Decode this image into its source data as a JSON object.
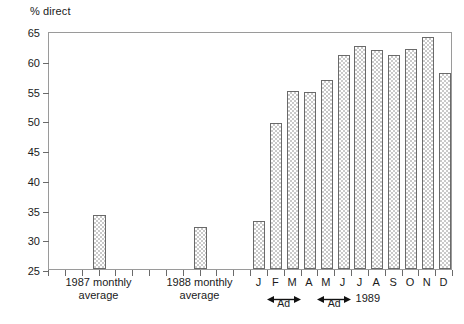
{
  "chart_data": {
    "type": "bar",
    "title": "",
    "ylabel": "% direct",
    "xlabel": "",
    "ylim": [
      25,
      65
    ],
    "ytick_labels": [
      "25",
      "30",
      "35",
      "40",
      "45",
      "50",
      "55",
      "60",
      "65"
    ],
    "ytick_values": [
      25,
      30,
      35,
      40,
      45,
      50,
      55,
      60,
      65
    ],
    "grid": false,
    "legend": "none",
    "categories": [
      "1987 monthly average",
      "1988 monthly average",
      "J",
      "F",
      "M",
      "A",
      "M",
      "J",
      "J",
      "A",
      "S",
      "O",
      "N",
      "D"
    ],
    "values": [
      34.1,
      32.0,
      33.0,
      49.5,
      55.0,
      54.7,
      56.8,
      61.0,
      62.5,
      61.8,
      61.0,
      62.0,
      64.0,
      58.0
    ],
    "series": [
      {
        "name": "% direct",
        "values": [
          34.1,
          32.0,
          33.0,
          49.5,
          55.0,
          54.7,
          56.8,
          61.0,
          62.5,
          61.8,
          61.0,
          62.0,
          64.0,
          58.0
        ]
      }
    ],
    "annotations": [
      {
        "label": "Ad",
        "span": [
          "F",
          "M"
        ]
      },
      {
        "label": "Ad",
        "span": [
          "M",
          "J"
        ]
      }
    ],
    "group_labels": [
      {
        "line1": "1987 monthly",
        "line2": "average"
      },
      {
        "line1": "1988 monthly",
        "line2": "average"
      }
    ],
    "year_label": "1989",
    "bar_face_color": "#fbfbfb",
    "bar_edge_color": "#6a6a6a",
    "frame_color": "#9a9a9a"
  },
  "axis": {
    "y_label": "% direct",
    "year_1989": "1989"
  },
  "month_labels": [
    "J",
    "F",
    "M",
    "A",
    "M",
    "J",
    "J",
    "A",
    "S",
    "O",
    "N",
    "D"
  ],
  "ad_markers": [
    {
      "text": "Ad"
    },
    {
      "text": "Ad"
    }
  ],
  "group_1987": {
    "line1": "1987 monthly",
    "line2": "average"
  },
  "group_1988": {
    "line1": "1988 monthly",
    "line2": "average"
  }
}
